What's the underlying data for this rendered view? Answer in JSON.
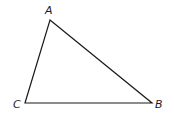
{
  "diagram": {
    "type": "triangle",
    "vertices": [
      {
        "label": "A",
        "x": 50,
        "y": 20
      },
      {
        "label": "B",
        "x": 152,
        "y": 103
      },
      {
        "label": "C",
        "x": 25,
        "y": 103
      }
    ],
    "edges": [
      [
        "A",
        "B"
      ],
      [
        "B",
        "C"
      ],
      [
        "C",
        "A"
      ]
    ],
    "stroke_color": "#1a1a1a"
  }
}
